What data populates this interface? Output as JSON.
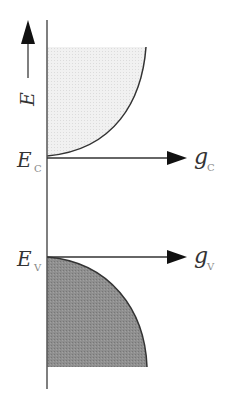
{
  "diagram": {
    "energy_axis": {
      "label": "E",
      "direction": "up"
    },
    "conduction_band": {
      "edge_label": "E",
      "edge_subscript": "C",
      "dos_label": "g",
      "dos_subscript": "C",
      "fill_color": "#eeeeee"
    },
    "valence_band": {
      "edge_label": "E",
      "edge_subscript": "V",
      "dos_label": "g",
      "dos_subscript": "V",
      "fill_color": "#8c8c8c"
    },
    "colors": {
      "line": "#333333",
      "axis": "#555555"
    }
  }
}
